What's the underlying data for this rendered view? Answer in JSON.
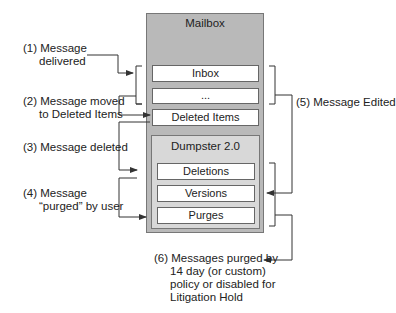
{
  "mailbox": {
    "title": "Mailbox",
    "folders": [
      "Inbox",
      "...",
      "Deleted Items"
    ]
  },
  "dumpster": {
    "title": "Dumpster 2.0",
    "folders": [
      "Deletions",
      "Versions",
      "Purges"
    ]
  },
  "steps": {
    "s1": {
      "line1": "(1) Message",
      "line2": "delivered"
    },
    "s2": {
      "line1": "(2) Message moved",
      "line2": "to Deleted Items"
    },
    "s3": {
      "line1": "(3) Message deleted"
    },
    "s4": {
      "line1": "(4) Message",
      "line2": "“purged” by user"
    },
    "s5": {
      "line1": "(5) Message Edited"
    },
    "s6": {
      "line1": "(6) Messages purged by",
      "line2": "14 day (or custom)",
      "line3": "policy or disabled for",
      "line4": "Litigation Hold"
    }
  },
  "colors": {
    "mailbox_fill": "#b9b9b9",
    "dumpster_fill": "#d8d8d8",
    "folder_fill": "#ffffff",
    "line": "#333333"
  }
}
